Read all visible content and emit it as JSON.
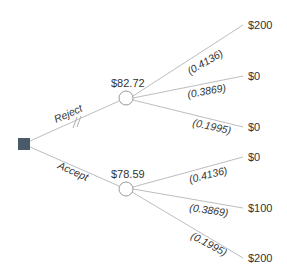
{
  "diagram": {
    "type": "decision-tree",
    "colors": {
      "line": "#bdbdbd",
      "decision_node": "#4a5a68",
      "chance_node_fill": "#ffffff",
      "chance_node_stroke": "#9a9a9a",
      "text": "#333333"
    },
    "decision": {
      "shape": "square",
      "branches": [
        {
          "label": "Reject",
          "blocked": true,
          "block_mark": "//",
          "chance_node": {
            "expected_value": "$82.72",
            "outcomes": [
              {
                "probability": "(0.4136)",
                "payoff": "$200"
              },
              {
                "probability": "(0.3869)",
                "payoff": "$0"
              },
              {
                "probability": "(0.1995)",
                "payoff": "$0"
              }
            ]
          }
        },
        {
          "label": "Accept",
          "blocked": false,
          "chance_node": {
            "expected_value": "$78.59",
            "outcomes": [
              {
                "probability": "(0.4136)",
                "payoff": "$0"
              },
              {
                "probability": "(0.3869)",
                "payoff": "$100"
              },
              {
                "probability": "(0.1995)",
                "payoff": "$200"
              }
            ]
          }
        }
      ]
    }
  }
}
